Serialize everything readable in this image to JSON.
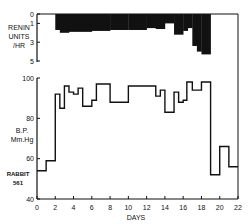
{
  "chart_data": [
    {
      "type": "bar",
      "panel": "top",
      "ylabel": "RENIN UNITS /HR",
      "ylabel_lines": [
        "RENIN",
        "UNITS",
        "/HR"
      ],
      "y_ticks": [
        "0",
        "1",
        "3",
        "5"
      ],
      "ylim": [
        0,
        5
      ],
      "y_inverted": true,
      "segments": [
        {
          "x0": 2.0,
          "x1": 2.5,
          "value": 1.7
        },
        {
          "x0": 2.5,
          "x1": 3.5,
          "value": 2.0
        },
        {
          "x0": 3.5,
          "x1": 6.0,
          "value": 1.9
        },
        {
          "x0": 6.0,
          "x1": 8.0,
          "value": 1.8
        },
        {
          "x0": 8.0,
          "x1": 10.0,
          "value": 1.7
        },
        {
          "x0": 10.0,
          "x1": 12.0,
          "value": 1.7
        },
        {
          "x0": 12.0,
          "x1": 13.0,
          "value": 1.5
        },
        {
          "x0": 13.0,
          "x1": 14.0,
          "value": 1.6
        },
        {
          "x0": 14.0,
          "x1": 15.0,
          "value": 1.0
        },
        {
          "x0": 15.0,
          "x1": 16.0,
          "value": 2.2
        },
        {
          "x0": 16.0,
          "x1": 16.5,
          "value": 1.8
        },
        {
          "x0": 16.5,
          "x1": 17.0,
          "value": 1.5
        },
        {
          "x0": 17.0,
          "x1": 17.5,
          "value": 3.4
        },
        {
          "x0": 17.5,
          "x1": 18.0,
          "value": 4.0
        },
        {
          "x0": 18.0,
          "x1": 19.0,
          "value": 4.3
        }
      ]
    },
    {
      "type": "line",
      "step": true,
      "panel": "bottom",
      "ylabel": "B.P. Mm.Hg",
      "ylabel_lines": [
        "B.P.",
        "Mm.Hg"
      ],
      "annotation": [
        "RABBIT",
        "561"
      ],
      "xlabel": "DAYS",
      "x_ticks": [
        "0",
        "2",
        "4",
        "6",
        "8",
        "10",
        "12",
        "14",
        "16",
        "18",
        "20",
        "22"
      ],
      "y_ticks": [
        "40",
        "60",
        "80",
        "100"
      ],
      "xlim": [
        0,
        22
      ],
      "ylim": [
        40,
        100
      ],
      "grid": false,
      "steps": [
        {
          "x0": 0.0,
          "x1": 1.0,
          "value": 54
        },
        {
          "x0": 1.0,
          "x1": 2.0,
          "value": 59
        },
        {
          "x0": 2.0,
          "x1": 2.5,
          "value": 92
        },
        {
          "x0": 2.5,
          "x1": 3.0,
          "value": 85
        },
        {
          "x0": 3.0,
          "x1": 3.5,
          "value": 96
        },
        {
          "x0": 3.5,
          "x1": 4.0,
          "value": 93
        },
        {
          "x0": 4.0,
          "x1": 4.5,
          "value": 92
        },
        {
          "x0": 4.5,
          "x1": 5.0,
          "value": 95
        },
        {
          "x0": 5.0,
          "x1": 6.0,
          "value": 86
        },
        {
          "x0": 6.0,
          "x1": 6.5,
          "value": 89
        },
        {
          "x0": 6.5,
          "x1": 8.0,
          "value": 97
        },
        {
          "x0": 8.0,
          "x1": 10.0,
          "value": 88
        },
        {
          "x0": 10.0,
          "x1": 13.0,
          "value": 96
        },
        {
          "x0": 13.0,
          "x1": 13.5,
          "value": 91
        },
        {
          "x0": 13.5,
          "x1": 14.0,
          "value": 94
        },
        {
          "x0": 14.0,
          "x1": 15.0,
          "value": 83
        },
        {
          "x0": 15.0,
          "x1": 15.5,
          "value": 93
        },
        {
          "x0": 15.5,
          "x1": 16.0,
          "value": 88
        },
        {
          "x0": 16.0,
          "x1": 16.4,
          "value": 89
        },
        {
          "x0": 16.4,
          "x1": 17.0,
          "value": 98
        },
        {
          "x0": 17.0,
          "x1": 18.0,
          "value": 94
        },
        {
          "x0": 18.0,
          "x1": 19.0,
          "value": 98
        },
        {
          "x0": 19.0,
          "x1": 20.0,
          "value": 52
        },
        {
          "x0": 20.0,
          "x1": 21.0,
          "value": 66
        },
        {
          "x0": 21.0,
          "x1": 22.0,
          "value": 56
        }
      ]
    }
  ],
  "colors": {
    "ink": "#111111",
    "paper": "#ffffff"
  }
}
